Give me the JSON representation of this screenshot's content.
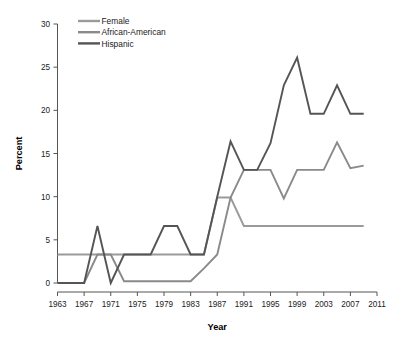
{
  "chart_data": {
    "type": "line",
    "title": "",
    "xlabel": "Year",
    "ylabel": "Percent",
    "xlim": [
      1963,
      2011
    ],
    "ylim": [
      0,
      30
    ],
    "xticks": [
      1963,
      1967,
      1971,
      1975,
      1979,
      1983,
      1987,
      1991,
      1995,
      1999,
      2003,
      2007,
      2011
    ],
    "yticks": [
      0,
      5,
      10,
      15,
      20,
      25,
      30
    ],
    "grid": false,
    "legend_position": "top-left",
    "x": [
      1963,
      1965,
      1967,
      1969,
      1971,
      1973,
      1975,
      1977,
      1979,
      1981,
      1983,
      1985,
      1987,
      1989,
      1991,
      1993,
      1995,
      1997,
      1999,
      2001,
      2003,
      2005,
      2007,
      2009
    ],
    "series": [
      {
        "name": "Female",
        "color": "#9a9a9a",
        "values": [
          3.3,
          3.3,
          3.3,
          3.3,
          3.3,
          3.3,
          3.3,
          3.3,
          3.3,
          3.3,
          3.3,
          3.3,
          9.9,
          9.9,
          6.6,
          6.6,
          6.6,
          6.6,
          6.6,
          6.6,
          6.6,
          6.6,
          6.6,
          6.6
        ]
      },
      {
        "name": "African-American",
        "color": "#8a8a8a",
        "values": [
          0.0,
          0.0,
          0.0,
          3.3,
          3.3,
          0.2,
          0.2,
          0.2,
          0.2,
          0.2,
          0.2,
          1.7,
          3.3,
          9.9,
          13.1,
          13.1,
          13.1,
          9.8,
          13.1,
          13.1,
          13.1,
          16.3,
          13.3,
          13.6
        ]
      },
      {
        "name": "Hispanic",
        "color": "#555555",
        "values": [
          0.0,
          0.0,
          0.0,
          6.6,
          0.0,
          3.3,
          3.3,
          3.3,
          6.6,
          6.6,
          3.3,
          3.3,
          10.0,
          16.4,
          13.1,
          13.1,
          16.2,
          22.9,
          26.1,
          19.6,
          19.6,
          22.9,
          19.6,
          19.6
        ]
      }
    ]
  },
  "legend": {
    "items": [
      {
        "label": "Female"
      },
      {
        "label": "African-American"
      },
      {
        "label": "Hispanic"
      }
    ]
  },
  "axes": {
    "y_title": "Percent",
    "x_title": "Year"
  }
}
